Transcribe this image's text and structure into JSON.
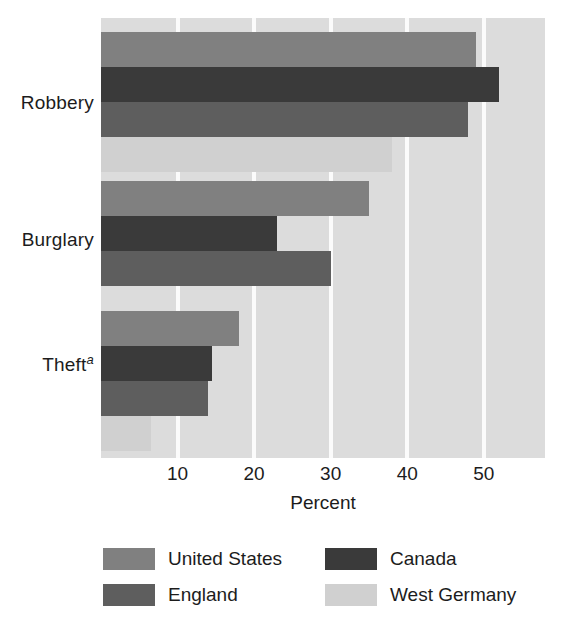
{
  "chart_data": {
    "type": "bar",
    "orientation": "horizontal",
    "title": "",
    "subtitle": "",
    "xlabel": "Percent",
    "ylabel": "",
    "categories": [
      "Robbery",
      "Burglary",
      "Theft"
    ],
    "category_labels": [
      "Robbery",
      "Burglary",
      "Theft"
    ],
    "category_footnote_markers": [
      "",
      "",
      "a"
    ],
    "series": [
      {
        "name": "United States",
        "color": "#808080",
        "values": [
          49,
          35,
          18
        ]
      },
      {
        "name": "Canada",
        "color": "#3a3a3a",
        "values": [
          52,
          23,
          14.5
        ]
      },
      {
        "name": "England",
        "color": "#5e5e5e",
        "values": [
          48,
          30,
          14
        ]
      },
      {
        "name": "West Germany",
        "color": "#d0d0d0",
        "values": [
          38,
          0,
          6.5
        ]
      }
    ],
    "xlim": [
      0,
      58
    ],
    "xticks": [
      10,
      20,
      30,
      40,
      50
    ],
    "xtick_labels": [
      "10",
      "20",
      "30",
      "40",
      "50"
    ],
    "grid": true,
    "gridline_color": "#fbfbfb",
    "plot_background": "#dcdcdc",
    "legend_position": "bottom",
    "legend_columns": 2
  },
  "axis": {
    "x_title": "Percent",
    "tick_labels": [
      "10",
      "20",
      "30",
      "40",
      "50"
    ]
  },
  "legend": {
    "items": [
      {
        "label": "United States",
        "color": "#808080"
      },
      {
        "label": "Canada",
        "color": "#3a3a3a"
      },
      {
        "label": "England",
        "color": "#5e5e5e"
      },
      {
        "label": "West Germany",
        "color": "#d0d0d0"
      }
    ]
  }
}
